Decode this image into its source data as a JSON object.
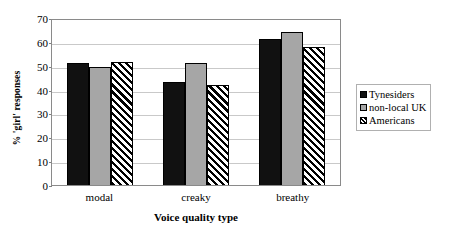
{
  "chart_data": {
    "type": "bar",
    "title": "",
    "subtitle": "",
    "xlabel": "Voice quality type",
    "ylabel": "% 'girl' responses",
    "categories": [
      "modal",
      "creaky",
      "breathy"
    ],
    "series": [
      {
        "name": "Tynesiders",
        "values": [
          51,
          43,
          61
        ]
      },
      {
        "name": "non-local UK",
        "values": [
          49.5,
          51,
          64
        ]
      },
      {
        "name": "Americans",
        "values": [
          51.5,
          42,
          58
        ]
      }
    ],
    "ylim": [
      0,
      70
    ],
    "ytick_step": 10,
    "yticks": [
      70,
      60,
      50,
      40,
      30,
      20,
      10,
      0
    ],
    "grid": true,
    "grid_axis": "y",
    "legend_position": "right",
    "series_styles": [
      "solid-black",
      "solid-gray",
      "diagonal-hatch"
    ],
    "colors": {
      "series_0": "#111111",
      "series_1": "#a6a6a6",
      "series_2": "#ffffff",
      "hatch": "#000000",
      "gridline": "#c9c9c9",
      "frame": "#8a8a8a",
      "background": "#ffffff"
    }
  }
}
